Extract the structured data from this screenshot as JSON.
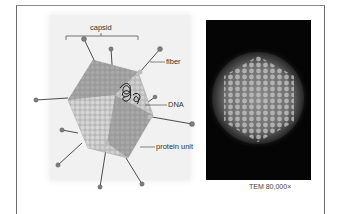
{
  "figure": {
    "diagram": {
      "labels": {
        "capsid": "capsid",
        "fiber": "fiber",
        "dna": "DNA",
        "protein_unit": "protein unit"
      }
    },
    "micrograph": {
      "caption": "TEM 80,000×"
    }
  },
  "colors": {
    "capsid_dark": "#8c8c8c",
    "capsid_light": "#c8c8c8",
    "fiber_line": "#3a3a3a",
    "fiber_knob": "#7a7a7a",
    "dna": "#1a1a1a",
    "tem_background": "#050505"
  }
}
